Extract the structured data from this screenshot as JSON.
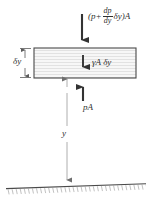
{
  "figure": {
    "type": "engineering-diagram",
    "width": 150,
    "height": 204,
    "background_color": "#ffffff",
    "line_color": "#3a3a3a",
    "thin_line_color": "#9a9a9a",
    "element_fill_color": "#f4f4f4"
  },
  "labels": {
    "top_force": {
      "text": "(p+ dp/dy δy)A",
      "open_paren": "(",
      "p_term": "p",
      "plus": "+",
      "frac_num": "dp",
      "frac_den": "dy",
      "delta_y": "δy",
      "close_paren": ")",
      "area": "A"
    },
    "weight": "γA δy",
    "bottom_force": "pA",
    "element_height": "δy",
    "depth": "y"
  },
  "geometry": {
    "element_box": {
      "x": 34,
      "y": 48,
      "width": 102,
      "height": 30
    },
    "top_arrow": {
      "x": 82,
      "y_from": 14,
      "y_to": 47,
      "direction": "down"
    },
    "weight_arrow": {
      "x": 83,
      "y_from": 56,
      "y_to": 74,
      "direction": "down"
    },
    "bottom_arrow": {
      "x": 83,
      "y_from": 101,
      "y_to": 80,
      "direction": "up"
    },
    "depth_line": {
      "x": 67,
      "y_from": 79,
      "y_to": 186,
      "style": "double-arrow"
    },
    "ground_line": {
      "x_from": 6,
      "y_from": 188,
      "x_to": 145,
      "y_to": 184,
      "hatched": true
    }
  }
}
